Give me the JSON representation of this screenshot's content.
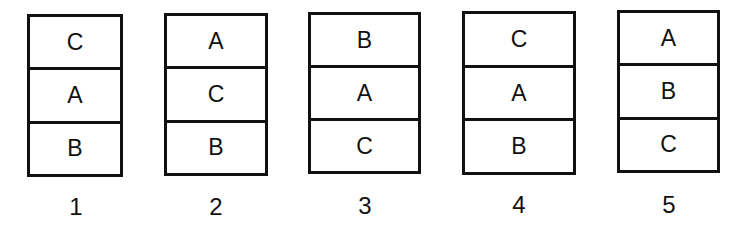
{
  "diagram": {
    "stacks": [
      {
        "number": "1",
        "cells": [
          "C",
          "A",
          "B"
        ]
      },
      {
        "number": "2",
        "cells": [
          "A",
          "C",
          "B"
        ]
      },
      {
        "number": "3",
        "cells": [
          "B",
          "A",
          "C"
        ]
      },
      {
        "number": "4",
        "cells": [
          "C",
          "A",
          "B"
        ]
      },
      {
        "number": "5",
        "cells": [
          "A",
          "B",
          "C"
        ]
      }
    ]
  }
}
